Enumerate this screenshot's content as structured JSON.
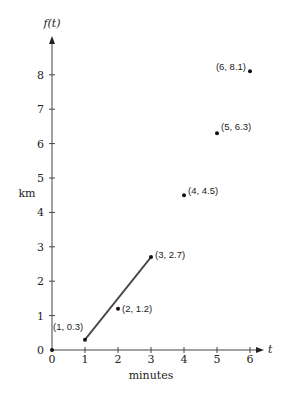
{
  "chart_data": {
    "type": "scatter",
    "title": "",
    "xlabel": "minutes",
    "ylabel": "km",
    "x_axis_name": "t",
    "y_axis_name": "f(t)",
    "xlim": [
      0,
      6
    ],
    "ylim": [
      0,
      8
    ],
    "x_ticks": [
      "0",
      "1",
      "2",
      "3",
      "4",
      "5",
      "6"
    ],
    "y_ticks": [
      "0",
      "1",
      "2",
      "3",
      "4",
      "5",
      "6",
      "7",
      "8"
    ],
    "grid": false,
    "legend": null,
    "points": [
      {
        "x": 1,
        "y": 0.3,
        "label": "(1, 0.3)"
      },
      {
        "x": 2,
        "y": 1.2,
        "label": "(2, 1.2)"
      },
      {
        "x": 3,
        "y": 2.7,
        "label": "(3, 2.7)"
      },
      {
        "x": 4,
        "y": 4.5,
        "label": "(4, 4.5)"
      },
      {
        "x": 5,
        "y": 6.3,
        "label": "(5, 6.3)"
      },
      {
        "x": 6,
        "y": 8.1,
        "label": "(6, 8.1)"
      }
    ],
    "origin_point": {
      "x": 0,
      "y": 0
    },
    "segment": {
      "from": {
        "x": 1,
        "y": 0.3
      },
      "to": {
        "x": 3,
        "y": 2.7
      }
    }
  }
}
